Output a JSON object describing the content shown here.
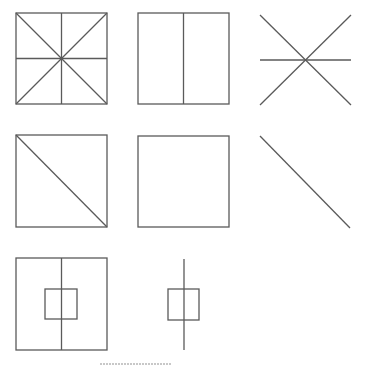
{
  "diagram": {
    "line_color": "#5a5a5a",
    "background": "#ffffff",
    "figures": [
      {
        "id": "square-with-diagonals-and-midlines",
        "row": 1,
        "col": 1
      },
      {
        "id": "square-with-vertical-midline",
        "row": 1,
        "col": 2
      },
      {
        "id": "asterisk-x-with-horizontal",
        "row": 1,
        "col": 3
      },
      {
        "id": "square-with-diagonal",
        "row": 2,
        "col": 1
      },
      {
        "id": "plain-square",
        "row": 2,
        "col": 2
      },
      {
        "id": "single-diagonal-line",
        "row": 2,
        "col": 3
      },
      {
        "id": "square-with-inner-square-and-vertical-line",
        "row": 3,
        "col": 1
      },
      {
        "id": "small-square-with-vertical-line",
        "row": 3,
        "col": 2
      }
    ]
  }
}
